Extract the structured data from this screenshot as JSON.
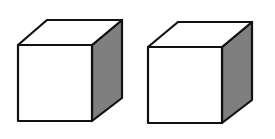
{
  "diagram": {
    "title": "",
    "colors": {
      "background": "#ffffff",
      "outline": "#111111",
      "front_face": "#ffffff",
      "top_face": "#ffffff",
      "side_face": "#7f7f7f"
    },
    "cubes": [
      {
        "id": "cube-1",
        "front": [
          [
            18,
            45
          ],
          [
            92,
            45
          ],
          [
            92,
            121
          ],
          [
            18,
            121
          ]
        ],
        "top": [
          [
            18,
            45
          ],
          [
            47,
            20
          ],
          [
            122,
            20
          ],
          [
            92,
            45
          ]
        ],
        "side": [
          [
            92,
            45
          ],
          [
            122,
            20
          ],
          [
            122,
            98
          ],
          [
            92,
            121
          ]
        ]
      },
      {
        "id": "cube-2",
        "front": [
          [
            148,
            47
          ],
          [
            222,
            47
          ],
          [
            222,
            123
          ],
          [
            148,
            123
          ]
        ],
        "top": [
          [
            148,
            47
          ],
          [
            178,
            22
          ],
          [
            252,
            22
          ],
          [
            222,
            47
          ]
        ],
        "side": [
          [
            222,
            47
          ],
          [
            252,
            22
          ],
          [
            252,
            100
          ],
          [
            222,
            123
          ]
        ]
      }
    ]
  }
}
